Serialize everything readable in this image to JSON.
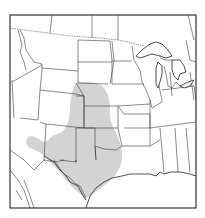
{
  "map": {
    "title": "",
    "region": "Central and Southern United States",
    "colors": {
      "background": "#ffffff",
      "borders": "#3a3a3a",
      "stipple": "#9a9a9a"
    },
    "shaded_region": {
      "pattern": "stipple",
      "description": "Stippled area over the southern Great Plains",
      "states_covered": [
        "Nebraska",
        "Colorado",
        "Kansas",
        "Oklahoma",
        "New Mexico",
        "Texas"
      ]
    },
    "features": [
      "state-borders",
      "us-canada-border",
      "great-lakes",
      "gulf-coast",
      "us-mexico-border"
    ]
  }
}
